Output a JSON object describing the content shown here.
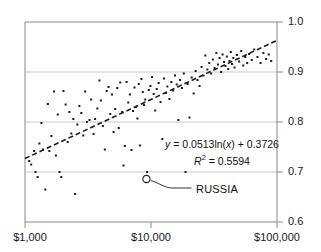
{
  "chart_data": {
    "type": "scatter",
    "title": "",
    "subtitle": "",
    "xlabel": "",
    "ylabel": "",
    "xscale": "log",
    "yscale": "linear",
    "xlim": [
      1000,
      100000
    ],
    "ylim": [
      0.6,
      1.0
    ],
    "x_ticks": [
      {
        "value": 1000,
        "label": "$1,000"
      },
      {
        "value": 10000,
        "label": "$10,000"
      },
      {
        "value": 100000,
        "label": "$100,000"
      }
    ],
    "y_ticks": [
      {
        "value": 1.0,
        "label": "1.0"
      },
      {
        "value": 0.9,
        "label": "0.9"
      },
      {
        "value": 0.8,
        "label": "0.8"
      },
      {
        "value": 0.7,
        "label": "0.7"
      },
      {
        "value": 0.6,
        "label": "0.6"
      }
    ],
    "y_axis_position": "right",
    "grid": {
      "horizontal": true,
      "vertical": false,
      "values": [
        0.9,
        0.8,
        0.7
      ],
      "color": "#c8c8c8"
    },
    "marker": {
      "shape": "square",
      "size": 2,
      "color": "#1a1a1a"
    },
    "series": [
      {
        "name": "countries",
        "points": [
          [
            1080,
            0.722
          ],
          [
            1120,
            0.715
          ],
          [
            1180,
            0.742
          ],
          [
            1210,
            0.7
          ],
          [
            1260,
            0.69
          ],
          [
            1300,
            0.757
          ],
          [
            1350,
            0.798
          ],
          [
            1390,
            0.745
          ],
          [
            1450,
            0.665
          ],
          [
            1520,
            0.836
          ],
          [
            1560,
            0.742
          ],
          [
            1620,
            0.772
          ],
          [
            1700,
            0.861
          ],
          [
            1760,
            0.733
          ],
          [
            1820,
            0.815
          ],
          [
            1880,
            0.7
          ],
          [
            1940,
            0.69
          ],
          [
            2020,
            0.862
          ],
          [
            2100,
            0.835
          ],
          [
            2180,
            0.76
          ],
          [
            2250,
            0.82
          ],
          [
            2330,
            0.777
          ],
          [
            2420,
            0.806
          ],
          [
            2500,
            0.656
          ],
          [
            2600,
            0.795
          ],
          [
            2700,
            0.832
          ],
          [
            2800,
            0.818
          ],
          [
            2900,
            0.773
          ],
          [
            3000,
            0.861
          ],
          [
            3100,
            0.8
          ],
          [
            3250,
            0.804
          ],
          [
            3350,
            0.845
          ],
          [
            3500,
            0.776
          ],
          [
            3600,
            0.806
          ],
          [
            3750,
            0.827
          ],
          [
            3900,
            0.883
          ],
          [
            4000,
            0.843
          ],
          [
            4150,
            0.792
          ],
          [
            4300,
            0.745
          ],
          [
            4450,
            0.862
          ],
          [
            4600,
            0.87
          ],
          [
            4750,
            0.816
          ],
          [
            4900,
            0.855
          ],
          [
            5050,
            0.78
          ],
          [
            5200,
            0.826
          ],
          [
            5400,
            0.868
          ],
          [
            5550,
            0.788
          ],
          [
            5700,
            0.879
          ],
          [
            5900,
            0.82
          ],
          [
            6050,
            0.713
          ],
          [
            6200,
            0.752
          ],
          [
            6400,
            0.88
          ],
          [
            6600,
            0.839
          ],
          [
            6800,
            0.855
          ],
          [
            7000,
            0.744
          ],
          [
            7200,
            0.822
          ],
          [
            7400,
            0.869
          ],
          [
            7600,
            0.83
          ],
          [
            7800,
            0.807
          ],
          [
            8000,
            0.876
          ],
          [
            8200,
            0.753
          ],
          [
            8400,
            0.886
          ],
          [
            8600,
            0.86
          ],
          [
            8800,
            0.834
          ],
          [
            9000,
            0.845
          ],
          [
            9300,
            0.7
          ],
          [
            9600,
            0.864
          ],
          [
            9900,
            0.872
          ],
          [
            10200,
            0.89
          ],
          [
            10500,
            0.856
          ],
          [
            10800,
            0.823
          ],
          [
            11100,
            0.866
          ],
          [
            11500,
            0.878
          ],
          [
            11900,
            0.84
          ],
          [
            12300,
            0.766
          ],
          [
            12700,
            0.887
          ],
          [
            13100,
            0.858
          ],
          [
            13500,
            0.871
          ],
          [
            14000,
            0.846
          ],
          [
            14500,
            0.88
          ],
          [
            15000,
            0.863
          ],
          [
            15500,
            0.893
          ],
          [
            16000,
            0.875
          ],
          [
            16500,
            0.804
          ],
          [
            17000,
            0.884
          ],
          [
            17600,
            0.868
          ],
          [
            18200,
            0.897
          ],
          [
            18800,
            0.7
          ],
          [
            19500,
            0.876
          ],
          [
            20200,
            0.809
          ],
          [
            21000,
            0.889
          ],
          [
            21800,
            0.857
          ],
          [
            22600,
            0.902
          ],
          [
            23400,
            0.884
          ],
          [
            24300,
            0.872
          ],
          [
            25200,
            0.91
          ],
          [
            26100,
            0.893
          ],
          [
            27000,
            0.933
          ],
          [
            28000,
            0.905
          ],
          [
            29000,
            0.918
          ],
          [
            30000,
            0.897
          ],
          [
            31000,
            0.925
          ],
          [
            32000,
            0.908
          ],
          [
            33000,
            0.938
          ],
          [
            34000,
            0.915
          ],
          [
            35000,
            0.928
          ],
          [
            36000,
            0.9
          ],
          [
            37000,
            0.935
          ],
          [
            38000,
            0.92
          ],
          [
            39000,
            0.912
          ],
          [
            40000,
            0.931
          ],
          [
            41000,
            0.906
          ],
          [
            42000,
            0.922
          ],
          [
            43000,
            0.94
          ],
          [
            44000,
            0.916
          ],
          [
            45000,
            0.928
          ],
          [
            46000,
            0.909
          ],
          [
            48000,
            0.934
          ],
          [
            50000,
            0.921
          ],
          [
            52000,
            0.942
          ],
          [
            54000,
            0.913
          ],
          [
            56000,
            0.93
          ],
          [
            58000,
            0.918
          ],
          [
            60000,
            0.936
          ],
          [
            63000,
            0.924
          ],
          [
            66000,
            0.945
          ],
          [
            70000,
            0.93
          ],
          [
            74000,
            0.918
          ],
          [
            78000,
            0.938
          ],
          [
            82000,
            0.926
          ],
          [
            86000,
            0.935
          ],
          [
            90000,
            0.922
          ]
        ]
      }
    ],
    "highlight": {
      "label": "RUSSIA",
      "x": 9200,
      "y": 0.686,
      "marker": "open-circle"
    },
    "trendline": {
      "type": "logarithmic",
      "equation": "y = 0.0513ln(x) + 0.3726",
      "equation_parts": {
        "y": "y",
        "body": " = 0.0513ln(",
        "x": "x",
        "tail": ") + 0.3726"
      },
      "r_squared_label": "R",
      "r_squared_sup": "2",
      "r_squared_value": " = 0.5594",
      "slope": 0.0513,
      "intercept": 0.3726,
      "r_squared": 0.5594,
      "style": "dashed",
      "color": "#1a1a1a"
    },
    "annotations": [
      {
        "name": "equation",
        "text": "y = 0.0513ln(x) + 0.3726"
      },
      {
        "name": "r-squared",
        "text": "R2 = 0.5594"
      },
      {
        "name": "russia-callout",
        "text": "RUSSIA"
      }
    ]
  }
}
